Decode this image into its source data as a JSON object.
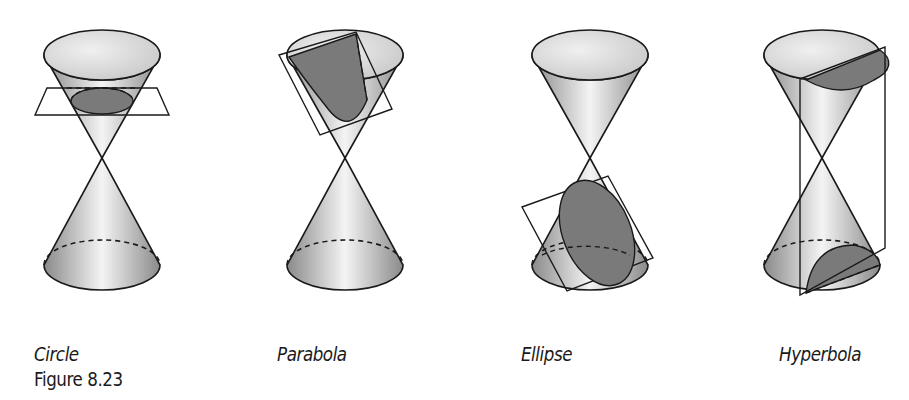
{
  "figure": {
    "caption": "Figure 8.23",
    "panels": [
      {
        "label": "Circle",
        "section": "circle"
      },
      {
        "label": "Parabola",
        "section": "parabola"
      },
      {
        "label": "Ellipse",
        "section": "ellipse"
      },
      {
        "label": "Hyperbola",
        "section": "hyperbola"
      }
    ],
    "colors": {
      "section_fill": "#7a7a7a",
      "cone_dark": "#8c8c8c",
      "cone_light": "#f2f2f2",
      "outline": "#1a1a1a"
    }
  }
}
